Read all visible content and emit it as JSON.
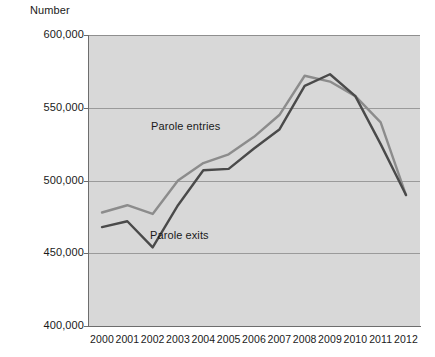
{
  "chart_data": {
    "type": "line",
    "title": "",
    "ylabel": "Number",
    "xlabel": "",
    "grid": true,
    "legend_position": "inline-annotations",
    "ylim": [
      400000,
      600000
    ],
    "y_ticks": [
      "400,000",
      "450,000",
      "500,000",
      "550,000",
      "600,000"
    ],
    "y_tick_values": [
      400000,
      450000,
      500000,
      550000,
      600000
    ],
    "categories": [
      "2000",
      "2001",
      "2002",
      "2003",
      "2004",
      "2005",
      "2006",
      "2007",
      "2008",
      "2009",
      "2010",
      "2011",
      "2012"
    ],
    "x": [
      2000,
      2001,
      2002,
      2003,
      2004,
      2005,
      2006,
      2007,
      2008,
      2009,
      2010,
      2011,
      2012
    ],
    "series": [
      {
        "name": "Parole entries",
        "color": "#8c8c8c",
        "values": [
          478000,
          483000,
          477000,
          500000,
          512000,
          518000,
          530000,
          545000,
          572000,
          568000,
          558000,
          540000,
          490000
        ]
      },
      {
        "name": "Parole exits",
        "color": "#4a4a4a",
        "values": [
          468000,
          472000,
          454000,
          483000,
          507000,
          508000,
          522000,
          535000,
          565000,
          573000,
          558000,
          525000,
          490000
        ]
      }
    ],
    "annotations": [
      {
        "text": "Parole entries",
        "series": "Parole entries"
      },
      {
        "text": "Parole exits",
        "series": "Parole exits"
      }
    ],
    "plot_background": "#d8d8d8",
    "gridline_color": "#9a9a9a"
  }
}
